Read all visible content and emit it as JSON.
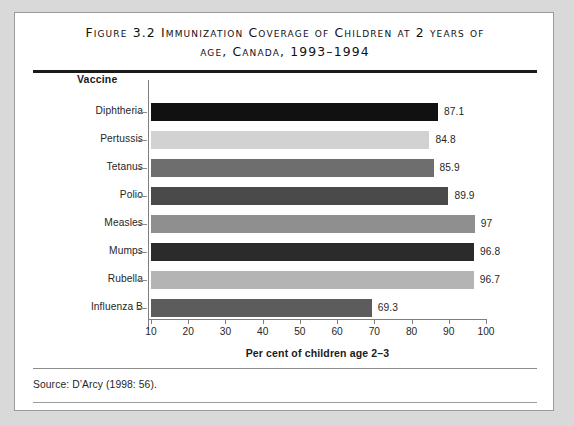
{
  "figure": {
    "title": "Figure 3.2  Immunization Coverage of Children at 2 years of\nage, Canada, 1993–1994",
    "source": "Source:  D’Arcy (1998: 56)."
  },
  "chart_data": {
    "type": "bar",
    "orientation": "horizontal",
    "title": "Figure 3.2  Immunization Coverage of Children at 2 years of age, Canada, 1993–1994",
    "categories": [
      "Diphtheria",
      "Pertussis",
      "Tetanus",
      "Polio",
      "Measles",
      "Mumps",
      "Rubella",
      "Influenza B"
    ],
    "values": [
      87.1,
      84.8,
      85.9,
      89.9,
      97,
      96.8,
      96.7,
      69.3
    ],
    "value_labels": [
      "87.1",
      "84.8",
      "85.9",
      "89.9",
      "97",
      "96.8",
      "96.7",
      "69.3"
    ],
    "bar_colors": [
      "#111111",
      "#d2d2d2",
      "#6e6e6e",
      "#4a4a4a",
      "#8f8f8f",
      "#2b2b2b",
      "#b4b4b4",
      "#5c5c5c"
    ],
    "ylabel": "Vaccine",
    "xlabel": "Per cent of children age 2–3",
    "xlim": [
      10,
      100
    ],
    "xticks": [
      10,
      20,
      30,
      40,
      50,
      60,
      70,
      80,
      90,
      100
    ],
    "xtick_labels": [
      "10",
      "20",
      "30",
      "40",
      "50",
      "60",
      "70",
      "80",
      "90",
      "100"
    ],
    "grid": false,
    "legend": false
  }
}
